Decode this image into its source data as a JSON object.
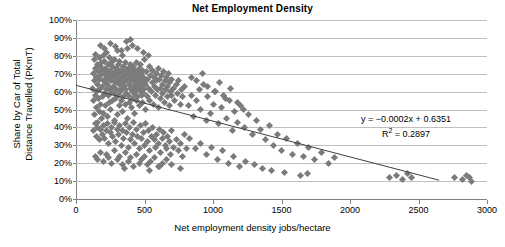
{
  "chart_data": {
    "type": "scatter",
    "title": "Net Employment Density",
    "xlabel": "Net employment density jobs/hectare",
    "ylabel_line1": "Share by Car of Total",
    "ylabel_line2": "Distance Travelled (PKmT)",
    "xlim": [
      0,
      3000
    ],
    "ylim": [
      0,
      1.0
    ],
    "xticks": [
      0,
      500,
      1000,
      1500,
      2000,
      2500,
      3000
    ],
    "xtick_labels": [
      "0",
      "500",
      "1000",
      "1500",
      "2000",
      "2500",
      "3000"
    ],
    "yticks": [
      0,
      0.1,
      0.2,
      0.3,
      0.4,
      0.5,
      0.6,
      0.7,
      0.8,
      0.9,
      1.0
    ],
    "ytick_labels": [
      "0%",
      "10%",
      "20%",
      "30%",
      "40%",
      "50%",
      "60%",
      "70%",
      "80%",
      "90%",
      "100%"
    ],
    "grid": "horizontal",
    "legend": "none",
    "marker": "diamond",
    "marker_color": "#7b7b7b",
    "trendline": {
      "type": "linear",
      "slope": -0.0002,
      "intercept": 0.6351,
      "r_squared": 0.2897,
      "color": "#404040",
      "x_start": 0,
      "x_end": 2650
    },
    "annotations": {
      "equation": "y = −0.0002x + 0.6351",
      "r_squared": "R² = 0.2897"
    },
    "points": [
      [
        120,
        0.62
      ],
      [
        125,
        0.7
      ],
      [
        130,
        0.55
      ],
      [
        132,
        0.78
      ],
      [
        135,
        0.47
      ],
      [
        138,
        0.66
      ],
      [
        140,
        0.73
      ],
      [
        142,
        0.58
      ],
      [
        145,
        0.81
      ],
      [
        148,
        0.51
      ],
      [
        150,
        0.68
      ],
      [
        152,
        0.6
      ],
      [
        155,
        0.75
      ],
      [
        157,
        0.43
      ],
      [
        160,
        0.64
      ],
      [
        162,
        0.71
      ],
      [
        165,
        0.56
      ],
      [
        168,
        0.79
      ],
      [
        170,
        0.49
      ],
      [
        172,
        0.67
      ],
      [
        175,
        0.61
      ],
      [
        178,
        0.74
      ],
      [
        180,
        0.53
      ],
      [
        182,
        0.69
      ],
      [
        185,
        0.45
      ],
      [
        188,
        0.76
      ],
      [
        190,
        0.63
      ],
      [
        192,
        0.57
      ],
      [
        195,
        0.72
      ],
      [
        198,
        0.66
      ],
      [
        200,
        0.8
      ],
      [
        202,
        0.48
      ],
      [
        205,
        0.7
      ],
      [
        208,
        0.59
      ],
      [
        210,
        0.77
      ],
      [
        212,
        0.65
      ],
      [
        215,
        0.52
      ],
      [
        218,
        0.73
      ],
      [
        220,
        0.68
      ],
      [
        222,
        0.61
      ],
      [
        225,
        0.82
      ],
      [
        228,
        0.46
      ],
      [
        230,
        0.71
      ],
      [
        232,
        0.64
      ],
      [
        235,
        0.58
      ],
      [
        238,
        0.75
      ],
      [
        240,
        0.69
      ],
      [
        242,
        0.54
      ],
      [
        245,
        0.67
      ],
      [
        248,
        0.79
      ],
      [
        250,
        0.62
      ],
      [
        252,
        0.72
      ],
      [
        255,
        0.5
      ],
      [
        258,
        0.66
      ],
      [
        260,
        0.76
      ],
      [
        262,
        0.6
      ],
      [
        265,
        0.7
      ],
      [
        268,
        0.55
      ],
      [
        270,
        0.74
      ],
      [
        272,
        0.63
      ],
      [
        275,
        0.68
      ],
      [
        278,
        0.44
      ],
      [
        280,
        0.78
      ],
      [
        282,
        0.59
      ],
      [
        285,
        0.71
      ],
      [
        288,
        0.65
      ],
      [
        290,
        0.56
      ],
      [
        292,
        0.73
      ],
      [
        295,
        0.61
      ],
      [
        298,
        0.69
      ],
      [
        300,
        0.83
      ],
      [
        302,
        0.47
      ],
      [
        305,
        0.66
      ],
      [
        308,
        0.75
      ],
      [
        310,
        0.58
      ],
      [
        312,
        0.7
      ],
      [
        315,
        0.64
      ],
      [
        318,
        0.52
      ],
      [
        320,
        0.77
      ],
      [
        322,
        0.67
      ],
      [
        325,
        0.6
      ],
      [
        328,
        0.72
      ],
      [
        330,
        0.55
      ],
      [
        332,
        0.68
      ],
      [
        335,
        0.62
      ],
      [
        338,
        0.8
      ],
      [
        340,
        0.49
      ],
      [
        342,
        0.71
      ],
      [
        345,
        0.65
      ],
      [
        348,
        0.57
      ],
      [
        350,
        0.74
      ],
      [
        352,
        0.63
      ],
      [
        355,
        0.69
      ],
      [
        358,
        0.53
      ],
      [
        360,
        0.76
      ],
      [
        362,
        0.61
      ],
      [
        365,
        0.67
      ],
      [
        368,
        0.59
      ],
      [
        370,
        0.72
      ],
      [
        372,
        0.66
      ],
      [
        375,
        0.84
      ],
      [
        378,
        0.45
      ],
      [
        380,
        0.7
      ],
      [
        382,
        0.58
      ],
      [
        385,
        0.73
      ],
      [
        388,
        0.64
      ],
      [
        390,
        0.54
      ],
      [
        392,
        0.68
      ],
      [
        395,
        0.62
      ],
      [
        398,
        0.75
      ],
      [
        400,
        0.89
      ],
      [
        402,
        0.51
      ],
      [
        405,
        0.66
      ],
      [
        408,
        0.71
      ],
      [
        410,
        0.6
      ],
      [
        412,
        0.69
      ],
      [
        415,
        0.56
      ],
      [
        418,
        0.74
      ],
      [
        420,
        0.63
      ],
      [
        422,
        0.67
      ],
      [
        425,
        0.48
      ],
      [
        428,
        0.72
      ],
      [
        430,
        0.59
      ],
      [
        432,
        0.65
      ],
      [
        435,
        0.7
      ],
      [
        438,
        0.61
      ],
      [
        440,
        0.76
      ],
      [
        442,
        0.55
      ],
      [
        445,
        0.68
      ],
      [
        448,
        0.64
      ],
      [
        450,
        0.71
      ],
      [
        452,
        0.57
      ],
      [
        455,
        0.66
      ],
      [
        458,
        0.62
      ],
      [
        460,
        0.73
      ],
      [
        462,
        0.52
      ],
      [
        465,
        0.69
      ],
      [
        468,
        0.6
      ],
      [
        470,
        0.67
      ],
      [
        472,
        0.75
      ],
      [
        475,
        0.58
      ],
      [
        478,
        0.63
      ],
      [
        480,
        0.7
      ],
      [
        482,
        0.65
      ],
      [
        485,
        0.54
      ],
      [
        488,
        0.72
      ],
      [
        490,
        0.61
      ],
      [
        492,
        0.68
      ],
      [
        495,
        0.59
      ],
      [
        498,
        0.66
      ],
      [
        500,
        0.78
      ],
      [
        505,
        0.5
      ],
      [
        510,
        0.64
      ],
      [
        515,
        0.71
      ],
      [
        520,
        0.57
      ],
      [
        525,
        0.67
      ],
      [
        530,
        0.62
      ],
      [
        535,
        0.74
      ],
      [
        540,
        0.55
      ],
      [
        545,
        0.69
      ],
      [
        550,
        0.6
      ],
      [
        555,
        0.65
      ],
      [
        560,
        0.72
      ],
      [
        565,
        0.53
      ],
      [
        570,
        0.68
      ],
      [
        575,
        0.63
      ],
      [
        580,
        0.58
      ],
      [
        585,
        0.7
      ],
      [
        590,
        0.66
      ],
      [
        595,
        0.61
      ],
      [
        600,
        0.73
      ],
      [
        605,
        0.51
      ],
      [
        610,
        0.67
      ],
      [
        615,
        0.62
      ],
      [
        620,
        0.56
      ],
      [
        625,
        0.69
      ],
      [
        630,
        0.64
      ],
      [
        635,
        0.59
      ],
      [
        640,
        0.71
      ],
      [
        645,
        0.54
      ],
      [
        650,
        0.66
      ],
      [
        655,
        0.61
      ],
      [
        660,
        0.68
      ],
      [
        665,
        0.57
      ],
      [
        670,
        0.63
      ],
      [
        675,
        0.7
      ],
      [
        680,
        0.52
      ],
      [
        685,
        0.65
      ],
      [
        690,
        0.6
      ],
      [
        695,
        0.67
      ],
      [
        700,
        0.58
      ],
      [
        710,
        0.62
      ],
      [
        720,
        0.55
      ],
      [
        730,
        0.64
      ],
      [
        740,
        0.59
      ],
      [
        750,
        0.66
      ],
      [
        760,
        0.53
      ],
      [
        770,
        0.61
      ],
      [
        780,
        0.57
      ],
      [
        790,
        0.63
      ],
      [
        130,
        0.38
      ],
      [
        140,
        0.42
      ],
      [
        150,
        0.35
      ],
      [
        160,
        0.4
      ],
      [
        170,
        0.33
      ],
      [
        180,
        0.39
      ],
      [
        190,
        0.36
      ],
      [
        200,
        0.41
      ],
      [
        210,
        0.34
      ],
      [
        220,
        0.38
      ],
      [
        230,
        0.42
      ],
      [
        240,
        0.31
      ],
      [
        250,
        0.37
      ],
      [
        260,
        0.4
      ],
      [
        270,
        0.35
      ],
      [
        280,
        0.43
      ],
      [
        290,
        0.32
      ],
      [
        300,
        0.39
      ],
      [
        310,
        0.36
      ],
      [
        320,
        0.41
      ],
      [
        330,
        0.3
      ],
      [
        340,
        0.38
      ],
      [
        350,
        0.34
      ],
      [
        360,
        0.42
      ],
      [
        370,
        0.37
      ],
      [
        380,
        0.29
      ],
      [
        390,
        0.4
      ],
      [
        400,
        0.33
      ],
      [
        410,
        0.36
      ],
      [
        420,
        0.43
      ],
      [
        430,
        0.31
      ],
      [
        440,
        0.39
      ],
      [
        450,
        0.35
      ],
      [
        460,
        0.28
      ],
      [
        470,
        0.41
      ],
      [
        480,
        0.34
      ],
      [
        490,
        0.37
      ],
      [
        500,
        0.3
      ],
      [
        510,
        0.42
      ],
      [
        520,
        0.32
      ],
      [
        530,
        0.38
      ],
      [
        540,
        0.27
      ],
      [
        550,
        0.35
      ],
      [
        560,
        0.4
      ],
      [
        570,
        0.33
      ],
      [
        580,
        0.29
      ],
      [
        590,
        0.36
      ],
      [
        600,
        0.31
      ],
      [
        610,
        0.39
      ],
      [
        620,
        0.26
      ],
      [
        630,
        0.34
      ],
      [
        640,
        0.37
      ],
      [
        650,
        0.3
      ],
      [
        660,
        0.28
      ],
      [
        670,
        0.35
      ],
      [
        680,
        0.32
      ],
      [
        690,
        0.25
      ],
      [
        700,
        0.38
      ],
      [
        715,
        0.29
      ],
      [
        730,
        0.33
      ],
      [
        745,
        0.27
      ],
      [
        760,
        0.31
      ],
      [
        775,
        0.24
      ],
      [
        790,
        0.36
      ],
      [
        805,
        0.28
      ],
      [
        140,
        0.24
      ],
      [
        160,
        0.22
      ],
      [
        180,
        0.26
      ],
      [
        200,
        0.21
      ],
      [
        220,
        0.25
      ],
      [
        240,
        0.23
      ],
      [
        260,
        0.2
      ],
      [
        280,
        0.27
      ],
      [
        300,
        0.22
      ],
      [
        320,
        0.24
      ],
      [
        340,
        0.19
      ],
      [
        360,
        0.26
      ],
      [
        380,
        0.21
      ],
      [
        400,
        0.23
      ],
      [
        420,
        0.18
      ],
      [
        440,
        0.25
      ],
      [
        460,
        0.2
      ],
      [
        480,
        0.22
      ],
      [
        500,
        0.24
      ],
      [
        520,
        0.19
      ],
      [
        545,
        0.21
      ],
      [
        570,
        0.23
      ],
      [
        600,
        0.18
      ],
      [
        630,
        0.2
      ],
      [
        660,
        0.22
      ],
      [
        355,
        0.17
      ],
      [
        540,
        0.16
      ],
      [
        610,
        0.18
      ],
      [
        700,
        0.19
      ],
      [
        760,
        0.17
      ],
      [
        180,
        0.86
      ],
      [
        210,
        0.84
      ],
      [
        250,
        0.87
      ],
      [
        290,
        0.85
      ],
      [
        330,
        0.83
      ],
      [
        370,
        0.88
      ],
      [
        410,
        0.86
      ],
      [
        450,
        0.84
      ],
      [
        490,
        0.82
      ],
      [
        530,
        0.8
      ],
      [
        820,
        0.52
      ],
      [
        840,
        0.58
      ],
      [
        860,
        0.46
      ],
      [
        880,
        0.55
      ],
      [
        900,
        0.61
      ],
      [
        910,
        0.5
      ],
      [
        930,
        0.64
      ],
      [
        950,
        0.44
      ],
      [
        960,
        0.57
      ],
      [
        980,
        0.48
      ],
      [
        1000,
        0.53
      ],
      [
        1020,
        0.6
      ],
      [
        1040,
        0.42
      ],
      [
        1060,
        0.51
      ],
      [
        1080,
        0.58
      ],
      [
        1100,
        0.45
      ],
      [
        1120,
        0.55
      ],
      [
        1140,
        0.38
      ],
      [
        1160,
        0.49
      ],
      [
        1180,
        0.43
      ],
      [
        1200,
        0.52
      ],
      [
        1230,
        0.4
      ],
      [
        1260,
        0.47
      ],
      [
        1290,
        0.36
      ],
      [
        1320,
        0.44
      ],
      [
        1350,
        0.39
      ],
      [
        1380,
        0.33
      ],
      [
        1410,
        0.41
      ],
      [
        1440,
        0.3
      ],
      [
        1470,
        0.36
      ],
      [
        1500,
        0.27
      ],
      [
        1540,
        0.34
      ],
      [
        1580,
        0.25
      ],
      [
        1620,
        0.31
      ],
      [
        1660,
        0.24
      ],
      [
        1700,
        0.29
      ],
      [
        1740,
        0.22
      ],
      [
        1790,
        0.26
      ],
      [
        1840,
        0.2
      ],
      [
        1890,
        0.23
      ],
      [
        830,
        0.34
      ],
      [
        870,
        0.28
      ],
      [
        910,
        0.31
      ],
      [
        950,
        0.25
      ],
      [
        990,
        0.29
      ],
      [
        1030,
        0.22
      ],
      [
        1070,
        0.27
      ],
      [
        1110,
        0.2
      ],
      [
        1150,
        0.24
      ],
      [
        1190,
        0.18
      ],
      [
        1240,
        0.21
      ],
      [
        1300,
        0.19
      ],
      [
        1360,
        0.17
      ],
      [
        1430,
        0.16
      ],
      [
        1520,
        0.15
      ],
      [
        840,
        0.68
      ],
      [
        880,
        0.66
      ],
      [
        920,
        0.7
      ],
      [
        960,
        0.63
      ],
      [
        1010,
        0.6
      ],
      [
        1050,
        0.65
      ],
      [
        1090,
        0.56
      ],
      [
        1130,
        0.62
      ],
      [
        1180,
        0.54
      ],
      [
        1220,
        0.5
      ],
      [
        1640,
        0.13
      ],
      [
        1690,
        0.14
      ],
      [
        2290,
        0.12
      ],
      [
        2340,
        0.13
      ],
      [
        2380,
        0.11
      ],
      [
        2420,
        0.14
      ],
      [
        2450,
        0.12
      ],
      [
        2760,
        0.12
      ],
      [
        2820,
        0.11
      ],
      [
        2850,
        0.13
      ],
      [
        2870,
        0.12
      ],
      [
        2890,
        0.1
      ]
    ]
  }
}
